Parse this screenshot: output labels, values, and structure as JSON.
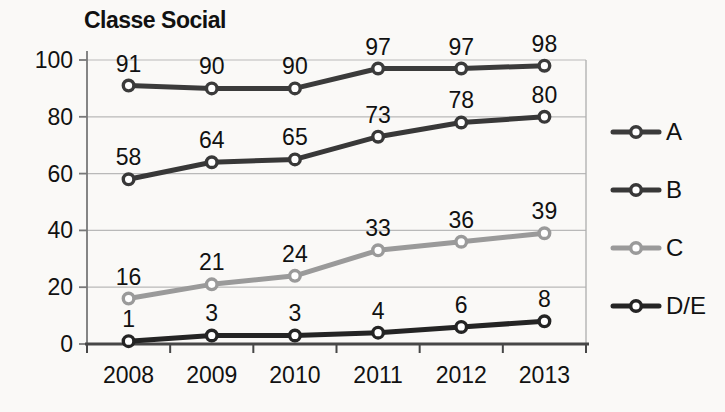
{
  "chart_data": {
    "type": "line",
    "title": "Classe Social",
    "categories": [
      "2008",
      "2009",
      "2010",
      "2011",
      "2012",
      "2013"
    ],
    "series": [
      {
        "name": "A",
        "values": [
          91,
          90,
          90,
          97,
          97,
          98
        ],
        "color": "#3b3b3b"
      },
      {
        "name": "B",
        "values": [
          58,
          64,
          65,
          73,
          78,
          80
        ],
        "color": "#383838"
      },
      {
        "name": "C",
        "values": [
          16,
          21,
          24,
          33,
          36,
          39
        ],
        "color": "#9a9a9a"
      },
      {
        "name": "D/E",
        "values": [
          1,
          3,
          3,
          4,
          6,
          8
        ],
        "color": "#242424"
      }
    ],
    "ylim": [
      0,
      100
    ],
    "y_ticks": [
      0,
      20,
      40,
      60,
      80,
      100
    ],
    "grid": true,
    "data_labels": true,
    "legend_position": "right",
    "colors": {
      "grid": "#b9b9b9",
      "x_axis": "#474747",
      "y_axis": "#787878",
      "plot_border": "#aeaeae",
      "text": "#111111",
      "marker_fill": "#ffffff",
      "background": "#faf9f7"
    }
  }
}
